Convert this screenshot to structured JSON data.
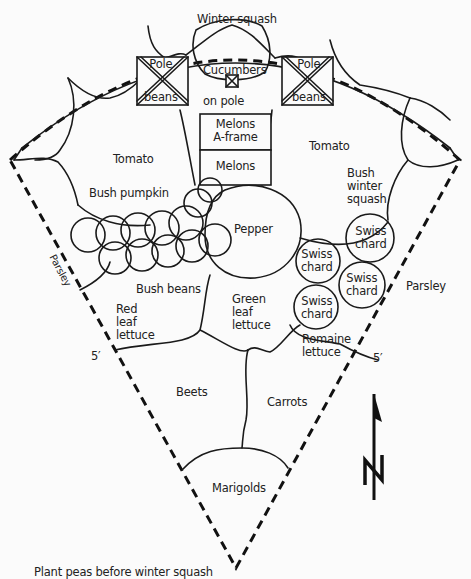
{
  "diagram": {
    "type": "garden-plan",
    "shape": "wedge / quarter-circle bed, 5' radius sides",
    "note": "Plant peas before winter squash",
    "compass": {
      "label": "N"
    },
    "dimensions": {
      "left_side": "5′",
      "right_side": "5′"
    },
    "labels": {
      "winter_squash": "Winter squash",
      "pole_beans_left": {
        "line1": "Pole",
        "line2": "beans"
      },
      "pole_beans_right": {
        "line1": "Pole",
        "line2": "beans"
      },
      "cucumbers": {
        "line1": "Cucumbers",
        "line2": "on pole"
      },
      "melons_aframe": {
        "line1": "Melons",
        "line2": "A-frame"
      },
      "melons": "Melons",
      "tomato_left": "Tomato",
      "tomato_right": "Tomato",
      "bush_pumpkin": "Bush pumpkin",
      "bush_winter_squash": {
        "line1": "Bush",
        "line2": "winter",
        "line3": "squash"
      },
      "parsley_left": "Parsley",
      "parsley_right": "Parsley",
      "pepper": "Pepper",
      "bush_beans": "Bush beans",
      "swiss_chard_1": {
        "line1": "Swiss",
        "line2": "chard"
      },
      "swiss_chard_2": {
        "line1": "Swiss",
        "line2": "chard"
      },
      "swiss_chard_3": {
        "line1": "Swiss",
        "line2": "chard"
      },
      "swiss_chard_4": {
        "line1": "Swiss",
        "line2": "chard"
      },
      "red_leaf_lettuce": {
        "line1": "Red",
        "line2": "leaf",
        "line3": "lettuce"
      },
      "green_leaf_lettuce": {
        "line1": "Green",
        "line2": "leaf",
        "line3": "lettuce"
      },
      "romaine_lettuce": {
        "line1": "Romaine",
        "line2": "lettuce"
      },
      "beets": "Beets",
      "carrots": "Carrots",
      "marigolds": "Marigolds"
    }
  }
}
